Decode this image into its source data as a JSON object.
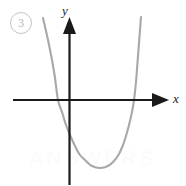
{
  "figure": {
    "item_number": "3",
    "watermark_text": "ANSWERS"
  },
  "axes": {
    "y_label": "y",
    "x_label": "x",
    "axis_color": "#1a1a1a",
    "origin": {
      "x": 69,
      "y": 100
    },
    "x_axis_from": 13,
    "x_axis_to": 168,
    "y_axis_from": 18,
    "y_axis_to": 185
  },
  "chart_data": {
    "type": "line",
    "title": "",
    "xlabel": "x",
    "ylabel": "y",
    "grid": false,
    "legend": "none",
    "xlim": [
      -2.3,
      5.0
    ],
    "ylim": [
      -3.2,
      3.3
    ],
    "series": [
      {
        "name": "parabola",
        "color": "#a8a8a8",
        "shape": "upward-parabola",
        "vertex": [
          1.25,
          -2.25
        ],
        "x_intercepts": [
          -0.4,
          2.9
        ],
        "y_intercept": -1.15,
        "x": [
          -0.85,
          -0.6,
          -0.4,
          -0.1,
          0.2,
          0.5,
          0.8,
          1.0,
          1.25,
          1.5,
          1.8,
          2.1,
          2.4,
          2.65,
          2.9,
          3.2,
          3.5
        ],
        "y": [
          2.2,
          0.95,
          0.0,
          -1.15,
          -1.85,
          -2.15,
          -2.25,
          -2.22,
          -2.25,
          -2.18,
          -1.95,
          -1.55,
          -0.9,
          -0.4,
          0.0,
          1.1,
          2.3
        ]
      }
    ],
    "points_px": [
      [
        43,
        18
      ],
      [
        48,
        40
      ],
      [
        52,
        60
      ],
      [
        55,
        78
      ],
      [
        58,
        100
      ],
      [
        62,
        112
      ],
      [
        66,
        125
      ],
      [
        70,
        135
      ],
      [
        75,
        146
      ],
      [
        80,
        155
      ],
      [
        86,
        161
      ],
      [
        92,
        166
      ],
      [
        100,
        168
      ],
      [
        108,
        166
      ],
      [
        114,
        161
      ],
      [
        119,
        154
      ],
      [
        123,
        145
      ],
      [
        126,
        136
      ],
      [
        129,
        125
      ],
      [
        132,
        112
      ],
      [
        134,
        100
      ],
      [
        136,
        82
      ],
      [
        138,
        56
      ],
      [
        140,
        30
      ],
      [
        141,
        17
      ]
    ]
  }
}
